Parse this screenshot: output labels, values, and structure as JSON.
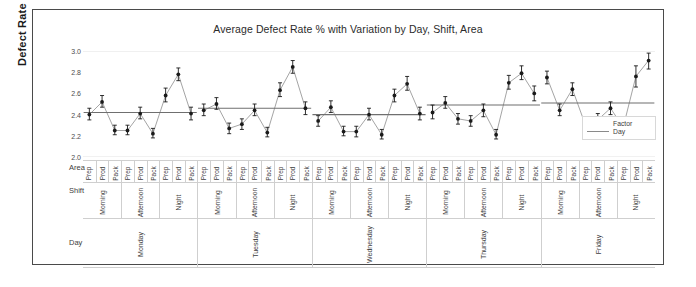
{
  "chart_data": {
    "type": "scatter",
    "title": "Average Defect Rate % with Variation by Day, Shift, Area",
    "xlabel": "",
    "ylabel": "Defect Rate %",
    "ylim": [
      2.0,
      3.0
    ],
    "yticks": [
      "2.0",
      "2.2",
      "2.4",
      "2.6",
      "2.8",
      "3.0"
    ],
    "grid": false,
    "legend": {
      "title": "Factor",
      "position": "inside-right",
      "entries": [
        {
          "label": "Day",
          "marker": "line",
          "color": "#8a8a8a"
        }
      ]
    },
    "row_labels": {
      "area": "Area",
      "shift": "Shift",
      "day": "Day"
    },
    "areas": [
      "Prep",
      "Prod",
      "Pack"
    ],
    "shifts": [
      "Morning",
      "Afternoon",
      "Night"
    ],
    "days": [
      "Monday",
      "Tuesday",
      "Wednesday",
      "Thursday",
      "Friday"
    ],
    "error_bar_note": "vertical error bars show variation around each mean",
    "points": [
      {
        "day": "Monday",
        "shift": "Morning",
        "area": "Prep",
        "value": 2.4,
        "low": 2.35,
        "high": 2.46
      },
      {
        "day": "Monday",
        "shift": "Morning",
        "area": "Prod",
        "value": 2.52,
        "low": 2.47,
        "high": 2.58
      },
      {
        "day": "Monday",
        "shift": "Morning",
        "area": "Pack",
        "value": 2.25,
        "low": 2.21,
        "high": 2.3
      },
      {
        "day": "Monday",
        "shift": "Afternoon",
        "area": "Prep",
        "value": 2.25,
        "low": 2.21,
        "high": 2.3
      },
      {
        "day": "Monday",
        "shift": "Afternoon",
        "area": "Prod",
        "value": 2.41,
        "low": 2.36,
        "high": 2.47
      },
      {
        "day": "Monday",
        "shift": "Afternoon",
        "area": "Pack",
        "value": 2.22,
        "low": 2.18,
        "high": 2.27
      },
      {
        "day": "Monday",
        "shift": "Night",
        "area": "Prep",
        "value": 2.58,
        "low": 2.52,
        "high": 2.65
      },
      {
        "day": "Monday",
        "shift": "Night",
        "area": "Prod",
        "value": 2.78,
        "low": 2.72,
        "high": 2.84
      },
      {
        "day": "Monday",
        "shift": "Night",
        "area": "Pack",
        "value": 2.41,
        "low": 2.35,
        "high": 2.47
      },
      {
        "day": "Tuesday",
        "shift": "Morning",
        "area": "Prep",
        "value": 2.44,
        "low": 2.39,
        "high": 2.5
      },
      {
        "day": "Tuesday",
        "shift": "Morning",
        "area": "Prod",
        "value": 2.5,
        "low": 2.45,
        "high": 2.56
      },
      {
        "day": "Tuesday",
        "shift": "Morning",
        "area": "Pack",
        "value": 2.27,
        "low": 2.22,
        "high": 2.32
      },
      {
        "day": "Tuesday",
        "shift": "Afternoon",
        "area": "Prep",
        "value": 2.31,
        "low": 2.26,
        "high": 2.36
      },
      {
        "day": "Tuesday",
        "shift": "Afternoon",
        "area": "Prod",
        "value": 2.44,
        "low": 2.39,
        "high": 2.5
      },
      {
        "day": "Tuesday",
        "shift": "Afternoon",
        "area": "Pack",
        "value": 2.23,
        "low": 2.19,
        "high": 2.28
      },
      {
        "day": "Tuesday",
        "shift": "Night",
        "area": "Prep",
        "value": 2.63,
        "low": 2.57,
        "high": 2.7
      },
      {
        "day": "Tuesday",
        "shift": "Night",
        "area": "Prod",
        "value": 2.85,
        "low": 2.79,
        "high": 2.91
      },
      {
        "day": "Tuesday",
        "shift": "Night",
        "area": "Pack",
        "value": 2.46,
        "low": 2.4,
        "high": 2.52
      },
      {
        "day": "Wednesday",
        "shift": "Morning",
        "area": "Prep",
        "value": 2.34,
        "low": 2.29,
        "high": 2.39
      },
      {
        "day": "Wednesday",
        "shift": "Morning",
        "area": "Prod",
        "value": 2.47,
        "low": 2.42,
        "high": 2.53
      },
      {
        "day": "Wednesday",
        "shift": "Morning",
        "area": "Pack",
        "value": 2.24,
        "low": 2.2,
        "high": 2.29
      },
      {
        "day": "Wednesday",
        "shift": "Afternoon",
        "area": "Prep",
        "value": 2.24,
        "low": 2.19,
        "high": 2.29
      },
      {
        "day": "Wednesday",
        "shift": "Afternoon",
        "area": "Prod",
        "value": 2.4,
        "low": 2.35,
        "high": 2.46
      },
      {
        "day": "Wednesday",
        "shift": "Afternoon",
        "area": "Pack",
        "value": 2.21,
        "low": 2.17,
        "high": 2.26
      },
      {
        "day": "Wednesday",
        "shift": "Night",
        "area": "Prep",
        "value": 2.58,
        "low": 2.52,
        "high": 2.64
      },
      {
        "day": "Wednesday",
        "shift": "Night",
        "area": "Prod",
        "value": 2.69,
        "low": 2.63,
        "high": 2.76
      },
      {
        "day": "Wednesday",
        "shift": "Night",
        "area": "Pack",
        "value": 2.41,
        "low": 2.35,
        "high": 2.47
      },
      {
        "day": "Thursday",
        "shift": "Morning",
        "area": "Prep",
        "value": 2.42,
        "low": 2.36,
        "high": 2.49
      },
      {
        "day": "Thursday",
        "shift": "Morning",
        "area": "Prod",
        "value": 2.51,
        "low": 2.46,
        "high": 2.57
      },
      {
        "day": "Thursday",
        "shift": "Morning",
        "area": "Pack",
        "value": 2.36,
        "low": 2.31,
        "high": 2.41
      },
      {
        "day": "Thursday",
        "shift": "Afternoon",
        "area": "Prep",
        "value": 2.34,
        "low": 2.29,
        "high": 2.39
      },
      {
        "day": "Thursday",
        "shift": "Afternoon",
        "area": "Prod",
        "value": 2.44,
        "low": 2.38,
        "high": 2.5
      },
      {
        "day": "Thursday",
        "shift": "Afternoon",
        "area": "Pack",
        "value": 2.21,
        "low": 2.17,
        "high": 2.26
      },
      {
        "day": "Thursday",
        "shift": "Night",
        "area": "Prep",
        "value": 2.7,
        "low": 2.64,
        "high": 2.77
      },
      {
        "day": "Thursday",
        "shift": "Night",
        "area": "Prod",
        "value": 2.79,
        "low": 2.73,
        "high": 2.86
      },
      {
        "day": "Thursday",
        "shift": "Night",
        "area": "Pack",
        "value": 2.6,
        "low": 2.53,
        "high": 2.67
      },
      {
        "day": "Friday",
        "shift": "Morning",
        "area": "Prep",
        "value": 2.75,
        "low": 2.69,
        "high": 2.81
      },
      {
        "day": "Friday",
        "shift": "Morning",
        "area": "Prod",
        "value": 2.44,
        "low": 2.39,
        "high": 2.5
      },
      {
        "day": "Friday",
        "shift": "Morning",
        "area": "Pack",
        "value": 2.64,
        "low": 2.58,
        "high": 2.7
      },
      {
        "day": "Friday",
        "shift": "Afternoon",
        "area": "Prep",
        "value": 2.31,
        "low": 2.26,
        "high": 2.37
      },
      {
        "day": "Friday",
        "shift": "Afternoon",
        "area": "Prod",
        "value": 2.35,
        "low": 2.3,
        "high": 2.41
      },
      {
        "day": "Friday",
        "shift": "Afternoon",
        "area": "Pack",
        "value": 2.46,
        "low": 2.4,
        "high": 2.52
      },
      {
        "day": "Friday",
        "shift": "Night",
        "area": "Prep",
        "value": 2.28,
        "low": 2.23,
        "high": 2.34
      },
      {
        "day": "Friday",
        "shift": "Night",
        "area": "Prod",
        "value": 2.76,
        "low": 2.66,
        "high": 2.86
      },
      {
        "day": "Friday",
        "shift": "Night",
        "area": "Pack",
        "value": 2.91,
        "low": 2.83,
        "high": 2.98
      }
    ],
    "day_means": [
      {
        "day": "Monday",
        "value": 2.42
      },
      {
        "day": "Tuesday",
        "value": 2.46
      },
      {
        "day": "Wednesday",
        "value": 2.4
      },
      {
        "day": "Thursday",
        "value": 2.49
      },
      {
        "day": "Friday",
        "value": 2.51
      }
    ],
    "colors": {
      "marker": "#1a1a1a",
      "connector": "#9a9a9a",
      "mean_line": "#6f6f6f",
      "axis": "#9a9a9a",
      "grid": "#e2e2e2",
      "frame": "#4a4a4a",
      "text": "#3d3d3d"
    }
  }
}
